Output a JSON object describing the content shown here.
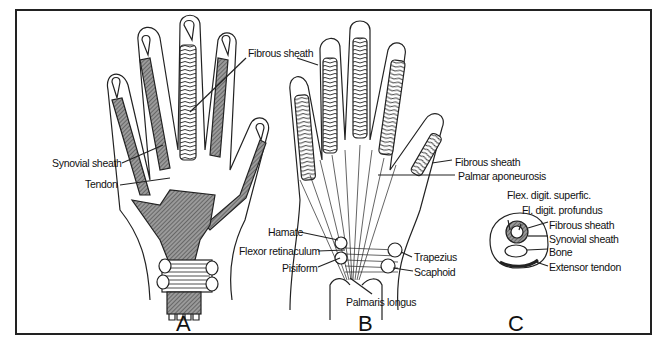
{
  "figure": {
    "panels": [
      {
        "id": "A",
        "label": "A",
        "annotations": [
          "Fibrous sheath",
          "Synovial sheath",
          "Tendon"
        ]
      },
      {
        "id": "B",
        "label": "B",
        "annotations": [
          "Fibrous sheath",
          "Palmar aponeurosis",
          "Hamate",
          "Flexor retinaculum",
          "Pisiform",
          "Trapezius",
          "Scaphoid",
          "Palmaris longus"
        ]
      },
      {
        "id": "C",
        "label": "C",
        "annotations": [
          "Flex. digit. superfic.",
          "Fl. digit. profundus",
          "Fibrous sheath",
          "Synovial sheath",
          "Bone",
          "Extensor tendon"
        ]
      }
    ]
  },
  "colors": {
    "line": "#222222",
    "shade": "#7a7a7a",
    "background": "#ffffff"
  }
}
